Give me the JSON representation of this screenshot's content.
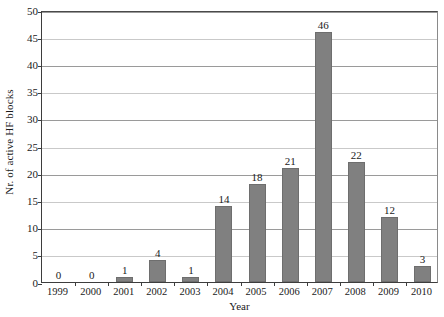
{
  "chart_data": {
    "type": "bar",
    "title": "",
    "xlabel": "Year",
    "ylabel": "Nr. of active HF blocks",
    "categories": [
      "1999",
      "2000",
      "2001",
      "2002",
      "2003",
      "2004",
      "2005",
      "2006",
      "2007",
      "2008",
      "2009",
      "2010"
    ],
    "values": [
      0,
      0,
      1,
      4,
      1,
      14,
      18,
      21,
      46,
      22,
      12,
      3
    ],
    "value_labels": [
      "0",
      "0",
      "1",
      "4",
      "1",
      "14",
      "18",
      "21",
      "46",
      "22",
      "12",
      "3"
    ],
    "ylim": [
      0,
      50
    ],
    "ytick_step": 5,
    "yticks": [
      0,
      5,
      10,
      15,
      20,
      25,
      30,
      35,
      40,
      45,
      50
    ],
    "ytick_labels": [
      "0",
      "5",
      "10",
      "15",
      "20",
      "25",
      "30",
      "35",
      "40",
      "45",
      "50"
    ],
    "grid": "horizontal",
    "legend": "none",
    "series": [
      {
        "name": "Nr. of active HF blocks",
        "values": [
          0,
          0,
          1,
          4,
          1,
          14,
          18,
          21,
          46,
          22,
          12,
          3
        ]
      }
    ],
    "colors": {
      "bar_fill": "#808080",
      "bar_border": "#6e6e6e",
      "axis": "#3d3d3d",
      "gridline_light": "#c9c9c9",
      "gridline_dark": "#9a9a9a",
      "background": "#ffffff",
      "text": "#1a1a1a"
    }
  }
}
